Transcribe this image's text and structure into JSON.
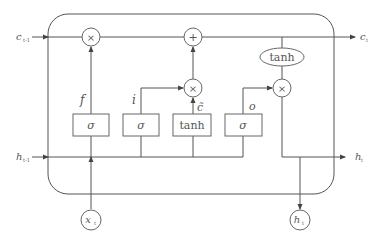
{
  "diagram": {
    "inputs": {
      "c_prev": {
        "label": "c",
        "sub": "t-1"
      },
      "h_prev": {
        "label": "h",
        "sub": "t-1"
      },
      "x_t": {
        "label": "x",
        "sub": "t"
      }
    },
    "outputs": {
      "c_t": {
        "label": "c",
        "sub": "t"
      },
      "h_t_right": {
        "label": "h",
        "sub": "t"
      },
      "h_t_bottom": {
        "label": "h",
        "sub": "t"
      }
    },
    "operators": {
      "forget_mult": "×",
      "add": "+",
      "input_mult": "×",
      "output_mult": "×",
      "tanh_cell": "tanh"
    },
    "gates": [
      {
        "id": "forget",
        "label": "f",
        "box": "σ"
      },
      {
        "id": "input",
        "label": "i",
        "box": "σ"
      },
      {
        "id": "candidate",
        "label": "c̃",
        "box": "tanh"
      },
      {
        "id": "output",
        "label": "o",
        "box": "σ"
      }
    ]
  }
}
